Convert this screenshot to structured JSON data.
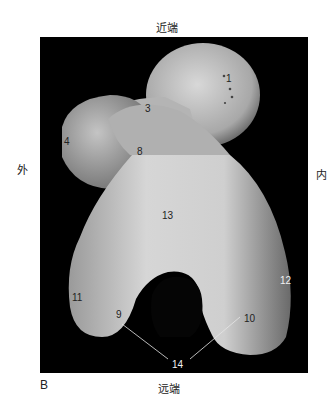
{
  "figure": {
    "panel_letter": "B",
    "orientation": {
      "top": "近端",
      "bottom": "远端",
      "left": "外",
      "right": "内"
    },
    "labels": [
      {
        "id": "1",
        "text": "1"
      },
      {
        "id": "3",
        "text": "3"
      },
      {
        "id": "4",
        "text": "4"
      },
      {
        "id": "8",
        "text": "8"
      },
      {
        "id": "13",
        "text": "13"
      },
      {
        "id": "12",
        "text": "12"
      },
      {
        "id": "11",
        "text": "11"
      },
      {
        "id": "9",
        "text": "9"
      },
      {
        "id": "10",
        "text": "10"
      },
      {
        "id": "14",
        "text": "14"
      }
    ],
    "colors": {
      "background": "#000000",
      "bone": "#c8c8c8",
      "page": "#ffffff"
    }
  }
}
